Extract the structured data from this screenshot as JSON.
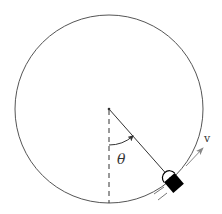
{
  "diagram": {
    "type": "physics-circular-motion",
    "circle": {
      "cx": 109,
      "cy": 109,
      "r": 94,
      "stroke": "#555555"
    },
    "center_point": {
      "x": 109,
      "y": 109
    },
    "vertical_reference": {
      "style": "dashed",
      "from_y": 109,
      "to_y": 203
    },
    "radius_line": {
      "to_x": 172,
      "to_y": 180
    },
    "angle": {
      "symbol": "θ",
      "label_x": 119,
      "label_y": 160
    },
    "object": {
      "cx": 174,
      "cy": 183,
      "angle_deg": -41,
      "fill": "#000000"
    },
    "velocity": {
      "label": "v",
      "label_x": 205,
      "label_y": 141,
      "color": "#888888"
    }
  }
}
